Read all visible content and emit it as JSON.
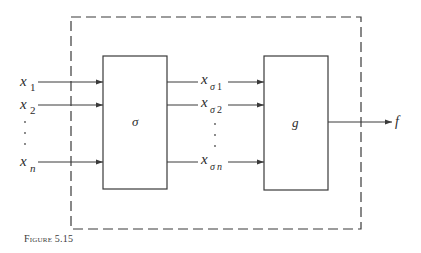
{
  "figure": {
    "caption": "Figure 5.15",
    "colors": {
      "stroke": "#3a3a3a",
      "text": "#2b2b2b",
      "background": "#ffffff"
    }
  },
  "diagram": {
    "outer_boundary": {
      "style": "dashed"
    },
    "blocks": [
      {
        "id": "sigma",
        "label": "σ"
      },
      {
        "id": "g",
        "label": "g"
      }
    ],
    "inputs": [
      {
        "base": "x",
        "sub": "1"
      },
      {
        "base": "x",
        "sub": "2"
      },
      {
        "base": "x",
        "sub": "n"
      }
    ],
    "intermediate": [
      {
        "base": "x",
        "sub_greek": "σ",
        "sub": "1"
      },
      {
        "base": "x",
        "sub_greek": "σ",
        "sub": "2"
      },
      {
        "base": "x",
        "sub_greek": "σ",
        "sub": "n"
      }
    ],
    "output": {
      "label": "f"
    }
  }
}
